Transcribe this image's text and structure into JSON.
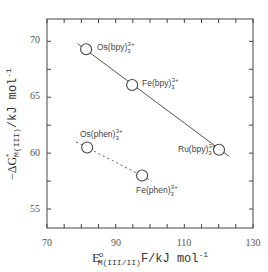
{
  "chart_data": {
    "type": "scatter",
    "title": "",
    "xlabel": "E°M(III/II)F / kJ mol⁻¹",
    "ylabel": "−ΔG*M(III) / kJ mol⁻¹",
    "xlim": [
      70,
      130
    ],
    "ylim": [
      53.3,
      72
    ],
    "x_ticks": [
      70,
      90,
      110,
      130
    ],
    "x_minor_step": 5,
    "y_ticks": [
      55,
      60,
      65,
      70
    ],
    "y_minor_step": 2.5,
    "grid": false,
    "legend": null,
    "series": [
      {
        "name": "bpy",
        "line_style": "solid",
        "points": [
          {
            "label": "Os(bpy)3 3+",
            "x": 81.4,
            "y": 69.3
          },
          {
            "label": "Fe(bpy)3 3+",
            "x": 94.8,
            "y": 66.1
          },
          {
            "label": "Ru(bpy)3 3+",
            "x": 120.1,
            "y": 60.3
          }
        ],
        "fit_line": {
          "x1": 78.9,
          "y1": 69.8,
          "x2": 123.1,
          "y2": 59.7
        }
      },
      {
        "name": "phen",
        "line_style": "dashed",
        "points": [
          {
            "label": "Os(phen)3 3+",
            "x": 81.7,
            "y": 60.5
          },
          {
            "label": "Fe(phen)3 3+",
            "x": 97.7,
            "y": 58.0
          }
        ],
        "fit_line": {
          "x1": 78.5,
          "y1": 61.0,
          "x2": 100.6,
          "y2": 57.5
        }
      }
    ]
  },
  "labels": {
    "x_axis": {
      "main": "E",
      "sup": "o",
      "sub": "M(III/II)",
      "rest": "F/kJ mol",
      "exp": "-1"
    },
    "y_axis": {
      "prefix": "−ΔG",
      "sup": "*",
      "sub": "M(III)",
      "rest": "/kJ mol",
      "exp": "-1"
    },
    "points": {
      "os_bpy": {
        "base": "Os(bpy)",
        "sub": "3",
        "sup": "3+"
      },
      "fe_bpy": {
        "base": "Fe(bpy)",
        "sub": "3",
        "sup": "3+"
      },
      "ru_bpy": {
        "base": "Ru(bpy)",
        "sub": "3",
        "sup": "3+"
      },
      "os_phen": {
        "base": "Os(phen)",
        "sub": "3",
        "sup": "3+"
      },
      "fe_phen": {
        "base": "Fe(phen)",
        "sub": "3",
        "sup": "3+"
      }
    },
    "x_tick_labels": [
      "70",
      "90",
      "110",
      "130"
    ],
    "y_tick_labels": [
      "55",
      "60",
      "65",
      "70"
    ]
  },
  "colors": {
    "axis": "#444444",
    "line": "#555555",
    "marker_stroke": "#444444",
    "marker_fill": "#ffffff"
  }
}
